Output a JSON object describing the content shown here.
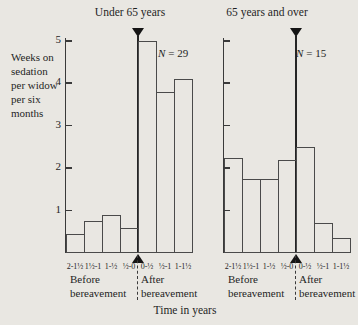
{
  "figure": {
    "ylabel_lines": [
      "Weeks on",
      "sedation",
      "per widow",
      "per six",
      "months"
    ],
    "xlabel": "Time in years",
    "background_color": "#e9e7e2",
    "line_color": "#3a3a3a"
  },
  "chart_data": [
    {
      "type": "bar",
      "title": "Under 65 years",
      "n": 29,
      "n_label": {
        "symbol": "N",
        "eq_value": "= 29"
      },
      "categories": [
        "2-1½",
        "1½-1",
        "1-½",
        "½-0",
        "0-½",
        "½-1",
        "1-1½"
      ],
      "values": [
        0.45,
        0.75,
        0.9,
        0.6,
        5.0,
        3.8,
        4.1
      ],
      "yticks": [
        1,
        2,
        3,
        4,
        5
      ],
      "ylim": [
        0,
        5
      ],
      "group_labels": {
        "before": [
          "Before",
          "bereavement"
        ],
        "after": [
          "After",
          "bereavement"
        ]
      }
    },
    {
      "type": "bar",
      "title": "65 years and over",
      "n": 15,
      "n_label": {
        "symbol": "N",
        "eq_value": "= 15"
      },
      "categories": [
        "2-1½",
        "1½-1",
        "1-½",
        "½-0",
        "0-½",
        "½-1",
        "1-1½"
      ],
      "values": [
        2.25,
        1.75,
        1.75,
        2.2,
        2.5,
        0.7,
        0.35
      ],
      "yticks": [
        1,
        2,
        3,
        4,
        5
      ],
      "ylim": [
        0,
        5
      ],
      "group_labels": {
        "before": [
          "Before",
          "bereavement"
        ],
        "after": [
          "After",
          "bereavement"
        ]
      }
    }
  ]
}
